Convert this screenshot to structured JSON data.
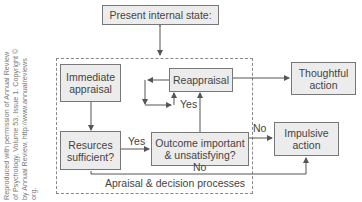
{
  "credit": {
    "lines": [
      "Reproduced with permission of Annual Review",
      "of Psychology, Volume 53, Issue 1. Copyright ©",
      "by Annual Review, http://www.annualreviews",
      "org."
    ]
  },
  "nodes": {
    "present_state": "Present internal state:",
    "immediate_appraisal": [
      "Immediate",
      "appraisal"
    ],
    "resources": [
      "Resurces",
      "sufficient?"
    ],
    "reappraisal": "Reappraisal",
    "thoughtful_action": [
      "Thoughtful",
      "action"
    ],
    "outcome": [
      "Outcome important",
      "& unsatisfying?"
    ],
    "impulsive_action": [
      "Impulsive",
      "action"
    ]
  },
  "edges": {
    "yes_resources_outcome": "Yes",
    "yes_outcome_reappraisal": "Yes",
    "no_outcome_impulsive": "No",
    "no_resources_impulsive": "No"
  },
  "container_label": "Apraisal & decision processes",
  "colors": {
    "box_fill": "#ececec",
    "box_border": "#777777",
    "line": "#555555"
  }
}
